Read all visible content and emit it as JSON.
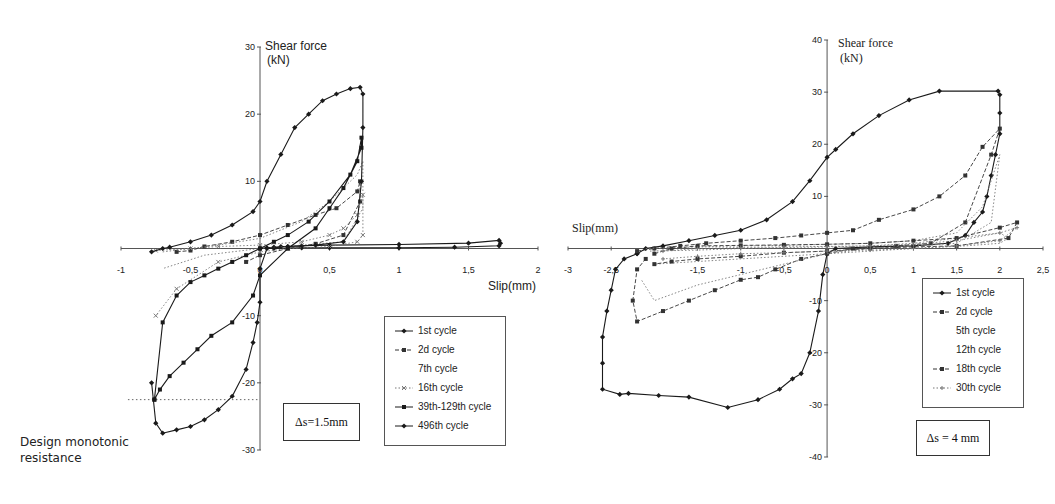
{
  "chart_data": [
    {
      "type": "line",
      "title": "",
      "xlabel": "Slip(mm)",
      "ylabel": "Shear force",
      "yunit": "(kN)",
      "xlim": [
        -1,
        2
      ],
      "ylim": [
        -30,
        30
      ],
      "xticks": [
        -1,
        -0.5,
        0,
        0.5,
        1,
        1.5,
        2
      ],
      "xtick_labels": [
        "-1",
        "-0,5",
        "0",
        "0,5",
        "1",
        "1,5",
        "2"
      ],
      "yticks": [
        -30,
        -20,
        -10,
        10,
        20,
        30
      ],
      "ytick_labels": [
        "-30",
        "-20",
        "-10",
        "10",
        "20",
        "30"
      ],
      "grid": false,
      "legend_position": "bottom-right",
      "annotation_box": "Δs=1.5mm",
      "annotation_text": [
        "Design monotonic",
        "resistance"
      ],
      "reference_line": {
        "label": "Design monotonic resistance",
        "y": -22.5,
        "x_range": [
          -0.95,
          0
        ]
      },
      "series": [
        {
          "name": "1st cycle",
          "marker": "diamond",
          "dash": "solid",
          "x": [
            0,
            0.05,
            0.1,
            0.15,
            0.2,
            0.3,
            0.5,
            1.0,
            1.5,
            1.72,
            1.73,
            1.72,
            1.4,
            1.0,
            0.5,
            0.3,
            0.1,
            0
          ],
          "y": [
            0,
            0.1,
            0.2,
            0.3,
            0.3,
            0.4,
            0.5,
            0.6,
            0.8,
            1.2,
            0.8,
            0.4,
            0.2,
            0.1,
            0.1,
            0.1,
            0.0,
            0
          ]
        },
        {
          "name": "2d cycle",
          "marker": "square",
          "dash": "dashed",
          "x": [
            -0.6,
            -0.5,
            -0.4,
            -0.2,
            0,
            0.2,
            0.4,
            0.55,
            0.7,
            0.72,
            0.72,
            0.6,
            0.4,
            0.2,
            0,
            -0.1
          ],
          "y": [
            -0.5,
            -0.3,
            0.3,
            1.0,
            2.0,
            3.5,
            5.0,
            6.0,
            8.5,
            10,
            7,
            2,
            0.7,
            0,
            -1,
            -2
          ]
        },
        {
          "name": "7th cycle",
          "marker": "none",
          "dash": "dotted",
          "x": [
            -0.7,
            -0.5,
            -0.3,
            0,
            0.3,
            0.5,
            0.7,
            0.74,
            0.74,
            0.6,
            0.3,
            0,
            -0.4,
            -0.7
          ],
          "y": [
            -0.5,
            0,
            0.5,
            1.5,
            4,
            7,
            11,
            13,
            6,
            1,
            0.5,
            0,
            -1,
            -3
          ]
        },
        {
          "name": "16th cycle",
          "marker": "cross",
          "dash": "dotted",
          "x": [
            -0.75,
            -0.5,
            -0.3,
            0,
            0.3,
            0.5,
            0.6,
            0.7,
            0.74,
            0.74,
            0.7,
            0.5,
            0.2,
            0,
            -0.3,
            -0.6,
            -0.75
          ],
          "y": [
            -0.3,
            0,
            0.3,
            0.5,
            1,
            2,
            3,
            5,
            8,
            2,
            1,
            0.3,
            0,
            -0.5,
            -2,
            -6,
            -10
          ]
        },
        {
          "name": "39th-129th cycle",
          "marker": "square",
          "dash": "solid",
          "x": [
            -0.76,
            -0.72,
            -0.65,
            -0.55,
            -0.45,
            -0.35,
            -0.2,
            -0.05,
            0,
            0.2,
            0.4,
            0.5,
            0.6,
            0.7,
            0.73,
            0.73,
            0.65,
            0.5,
            0.35,
            0.2,
            0.1,
            0,
            -0.1,
            -0.2,
            -0.3,
            -0.4,
            -0.5,
            -0.6,
            -0.7,
            -0.76
          ],
          "y": [
            -22.5,
            -21,
            -19,
            -17,
            -15,
            -13,
            -11,
            -7,
            -4,
            0,
            3,
            6,
            9,
            13,
            16.5,
            15,
            11,
            7,
            4,
            2,
            1,
            0,
            -1,
            -2,
            -3,
            -4,
            -5,
            -7,
            -11,
            -22.5
          ]
        },
        {
          "name": "496th cycle",
          "marker": "diamond",
          "dash": "solid",
          "x": [
            -0.78,
            -0.7,
            -0.65,
            -0.5,
            -0.35,
            -0.2,
            -0.05,
            0,
            0.05,
            0.15,
            0.25,
            0.35,
            0.45,
            0.55,
            0.65,
            0.72,
            0.74,
            0.74,
            0.73,
            0.7,
            0.6,
            0.4,
            0.2,
            0.05,
            0,
            0,
            -0.02,
            -0.05,
            -0.1,
            -0.2,
            -0.3,
            -0.4,
            -0.5,
            -0.6,
            -0.7,
            -0.75,
            -0.78
          ],
          "y": [
            -0.5,
            0,
            0.2,
            1,
            2,
            3.5,
            5.5,
            7,
            10,
            14,
            18,
            20,
            22,
            23,
            23.8,
            24,
            23,
            18,
            10,
            4,
            1,
            0.5,
            0.3,
            0,
            -3,
            -8,
            -11,
            -14,
            -18,
            -22,
            -24,
            -25.5,
            -26.5,
            -27,
            -27.5,
            -26,
            -20
          ]
        }
      ]
    },
    {
      "type": "line",
      "title": "",
      "xlabel": "Slip(mm)",
      "ylabel": "Shear force",
      "yunit": "(kN)",
      "xlim": [
        -3,
        2.5
      ],
      "ylim": [
        -40,
        40
      ],
      "xticks": [
        -3,
        -2.5,
        -2,
        -1.5,
        -1,
        -0.5,
        0,
        0.5,
        1,
        1.5,
        2,
        2.5
      ],
      "xtick_labels": [
        "-3",
        "-2,5",
        "",
        "-1,5",
        "-1",
        "-0,5",
        "0",
        "0,5",
        "1",
        "1,5",
        "2",
        "2,5"
      ],
      "yticks": [
        -40,
        -30,
        -20,
        -10,
        10,
        20,
        30,
        40
      ],
      "ytick_labels": [
        "-40",
        "-30",
        "-20",
        "-10",
        "10",
        "20",
        "30",
        "40"
      ],
      "grid": false,
      "legend_position": "bottom-right",
      "annotation_box": "Δs = 4 mm",
      "series": [
        {
          "name": "1st cycle",
          "marker": "diamond",
          "dash": "solid",
          "x": [
            -2.2,
            -2.1,
            -1.9,
            -1.6,
            -1.3,
            -1.0,
            -0.7,
            -0.4,
            -0.2,
            0,
            0.1,
            0.3,
            0.6,
            0.95,
            1.3,
            1.98,
            2.0,
            2.0,
            2.0,
            1.95,
            1.9,
            1.85,
            1.8,
            1.7,
            1.6,
            1.4,
            1.0,
            0.5,
            0.1,
            0,
            -0.05,
            -0.1,
            -0.2,
            -0.3,
            -0.4,
            -0.55,
            -0.8,
            -1.15,
            -1.6,
            -1.95,
            -2.3,
            -2.4,
            -2.6,
            -2.6,
            -2.6,
            -2.55,
            -2.5,
            -2.45,
            -2.35,
            -2.2
          ],
          "y": [
            -1,
            0,
            0.5,
            1.5,
            2.5,
            3.5,
            5.5,
            9,
            13,
            17.5,
            19,
            22,
            25.5,
            28.5,
            30.2,
            30.2,
            29.5,
            26,
            22,
            18,
            14,
            10,
            7,
            5,
            2.5,
            1,
            0.5,
            0.3,
            0,
            -1,
            -5,
            -12,
            -20,
            -24,
            -25,
            -27,
            -29,
            -30.5,
            -28.5,
            -28.2,
            -27.8,
            -28,
            -27,
            -22,
            -17,
            -12,
            -8,
            -4,
            -2,
            -1
          ]
        },
        {
          "name": "2d cycle",
          "marker": "square",
          "dash": "dashed",
          "x": [
            -2.2,
            -2.0,
            -1.7,
            -1.4,
            -1.0,
            -0.6,
            -0.3,
            0,
            0.3,
            0.6,
            1.0,
            1.3,
            1.6,
            1.8,
            2.0,
            1.9,
            1.6,
            1.2,
            0.8,
            0.3,
            0,
            -0.3,
            -0.6,
            -0.8,
            -1.0,
            -1.3,
            -1.6,
            -1.9,
            -2.2,
            -2.25,
            -2.2,
            -2.1
          ],
          "y": [
            -0.5,
            0,
            0.5,
            1.0,
            1.5,
            2.0,
            2.5,
            3,
            3.5,
            5.5,
            7.5,
            10,
            14,
            19.5,
            23,
            18,
            5,
            1,
            0.5,
            0,
            -1,
            -2,
            -4,
            -5.5,
            -6,
            -8,
            -10,
            -12,
            -14,
            -10,
            -4,
            -2
          ]
        },
        {
          "name": "5th cycle",
          "marker": "none",
          "dash": "dotted",
          "x": [
            -2.1,
            -1.5,
            -1.0,
            -0.5,
            0,
            0.5,
            1.0,
            1.5,
            1.8,
            2.0,
            1.9,
            1.5,
            1.0,
            0.5,
            0,
            -0.5,
            -1.0,
            -1.5,
            -2.0,
            -2.15
          ],
          "y": [
            0,
            0.3,
            0.5,
            0.6,
            0.8,
            1,
            1.5,
            3,
            8,
            18,
            5,
            1,
            0.5,
            0,
            -1,
            -3,
            -5,
            -7,
            -10,
            -6
          ]
        },
        {
          "name": "12th cycle",
          "marker": "none",
          "dash": "dotted",
          "x": [
            -2.05,
            -1.5,
            -1.0,
            -0.5,
            0,
            0.5,
            1.0,
            1.5,
            2.0,
            2.1,
            2.0,
            1.6,
            1.0,
            0.5,
            0,
            -0.5,
            -1.0,
            -1.5,
            -2.0
          ],
          "y": [
            -0.5,
            -0.3,
            0,
            0.2,
            0.3,
            0.5,
            1,
            2,
            3,
            2,
            1,
            0.5,
            0,
            -0.5,
            -1,
            -1.5,
            -2,
            -2.5,
            -3
          ]
        },
        {
          "name": "18th cycle",
          "marker": "square",
          "dash": "dashed",
          "x": [
            -2.0,
            -1.8,
            -1.5,
            -1.0,
            -0.5,
            0,
            0.5,
            1.0,
            1.5,
            2.0,
            2.2,
            2.1,
            1.5,
            1.0,
            0.5,
            0,
            -0.5,
            -1.0,
            -1.5,
            -1.8,
            -2.0
          ],
          "y": [
            -1,
            0,
            0.5,
            0.6,
            0.7,
            0.8,
            1,
            1.5,
            2,
            4,
            5,
            2,
            0.5,
            0.3,
            0,
            -0.5,
            -0.8,
            -1.5,
            -2,
            -2.5,
            -3
          ]
        },
        {
          "name": "30th cycle",
          "marker": "plus",
          "dash": "dotted",
          "x": [
            -1.9,
            -1.5,
            -1.0,
            -0.5,
            0,
            0.5,
            1.0,
            1.5,
            2.0,
            2.2,
            2.0,
            1.5,
            1.0,
            0.5,
            0,
            -0.5,
            -1.0,
            -1.5,
            -1.9
          ],
          "y": [
            -0.5,
            0,
            0.2,
            0.3,
            0.4,
            0.5,
            0.8,
            1.5,
            3,
            4,
            1.5,
            0.5,
            0,
            -0.3,
            -0.5,
            -0.8,
            -1,
            -1.5,
            -2
          ]
        }
      ]
    }
  ]
}
